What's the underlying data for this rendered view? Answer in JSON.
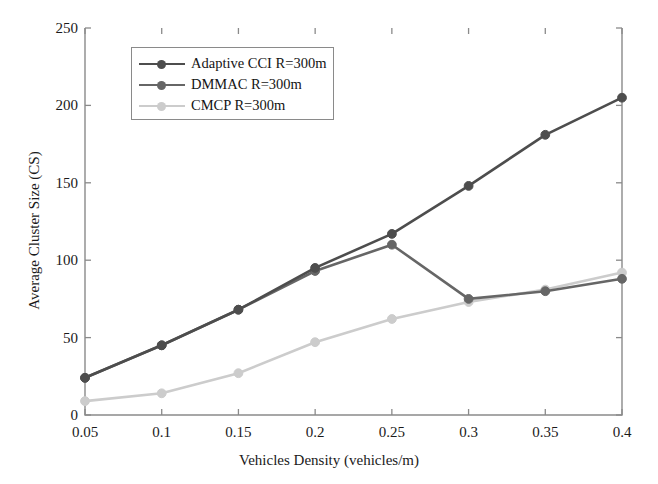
{
  "chart_data": {
    "type": "line",
    "title": "",
    "xlabel": "Vehicles Density (vehicles/m)",
    "ylabel": "Average Cluster Size (CS)",
    "x": [
      0.05,
      0.1,
      0.15,
      0.2,
      0.25,
      0.3,
      0.35,
      0.4
    ],
    "xticklabels": [
      "0.05",
      "0.1",
      "0.15",
      "0.2",
      "0.25",
      "0.3",
      "0.35",
      "0.4"
    ],
    "yticklabels": [
      "0",
      "50",
      "100",
      "150",
      "200",
      "250"
    ],
    "yticks": [
      0,
      50,
      100,
      150,
      200,
      250
    ],
    "xlim": [
      0.05,
      0.4
    ],
    "ylim": [
      0,
      250
    ],
    "grid": false,
    "legend_position": "upper-left-inside",
    "marker": "circle",
    "series": [
      {
        "name": "Adaptive CCI R=300m",
        "color": "#4d4d4d",
        "values": [
          24,
          45,
          68,
          95,
          117,
          148,
          181,
          205
        ]
      },
      {
        "name": "DMMAC R=300m",
        "color": "#666666",
        "values": [
          24,
          45,
          68,
          93,
          110,
          75,
          80,
          88
        ]
      },
      {
        "name": "CMCP R=300m",
        "color": "#cccccc",
        "values": [
          9,
          14,
          27,
          47,
          62,
          73,
          81,
          92
        ]
      }
    ]
  },
  "legend": {
    "entries": [
      {
        "label": "Adaptive CCI R=300m",
        "color": "#4d4d4d"
      },
      {
        "label": "DMMAC R=300m",
        "color": "#666666"
      },
      {
        "label": "CMCP R=300m",
        "color": "#cccccc"
      }
    ]
  },
  "axes": {
    "x_label": "Vehicles Density (vehicles/m)",
    "y_label": "Average Cluster Size (CS)"
  }
}
